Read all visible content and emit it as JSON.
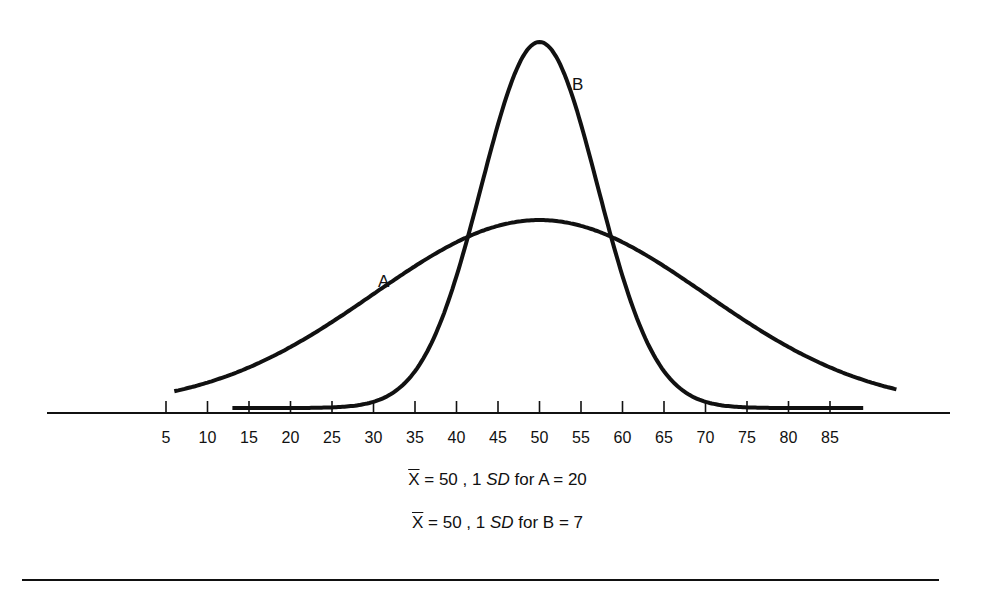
{
  "chart_data": {
    "type": "line",
    "title": "",
    "xlabel": "",
    "ylabel": "",
    "x_ticks": [
      5,
      10,
      15,
      20,
      25,
      30,
      35,
      40,
      45,
      50,
      55,
      60,
      65,
      70,
      75,
      80,
      85
    ],
    "xlim": [
      0,
      95
    ],
    "grid": false,
    "legend": null,
    "series": [
      {
        "name": "A",
        "distribution": "normal",
        "mean": 50,
        "sd": 20,
        "relative_peak_height": 0.52,
        "x_range": [
          6,
          93
        ]
      },
      {
        "name": "B",
        "distribution": "normal",
        "mean": 50,
        "sd": 7,
        "relative_peak_height": 1.0,
        "x_range": [
          13,
          89
        ]
      }
    ],
    "annotations": [
      {
        "text": "A",
        "near_x": 30
      },
      {
        "text": "B",
        "near_x": 54
      }
    ]
  },
  "labels": {
    "curve_a": "A",
    "curve_b": "B"
  },
  "axis": {
    "ticks": [
      "5",
      "10",
      "15",
      "20",
      "25",
      "30",
      "35",
      "40",
      "45",
      "50",
      "55",
      "60",
      "65",
      "70",
      "75",
      "80",
      "85"
    ]
  },
  "captions": {
    "line1": {
      "xbar": "X",
      "eq1": " = 50 , 1 ",
      "sd": "SD",
      "rest": " for A = 20"
    },
    "line2": {
      "xbar": "X",
      "eq1": " = 50 , 1 ",
      "sd": "SD",
      "rest": " for B = 7"
    }
  },
  "colors": {
    "ink": "#111111",
    "background": "#ffffff"
  }
}
